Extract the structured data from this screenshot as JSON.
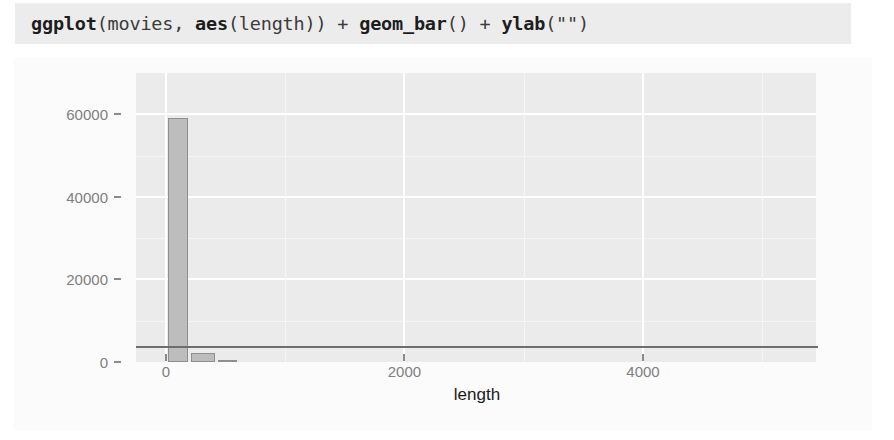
{
  "code": {
    "segments": [
      {
        "text": "ggplot",
        "bold": true
      },
      {
        "text": "(movies, ",
        "bold": false
      },
      {
        "text": "aes",
        "bold": true
      },
      {
        "text": "(length)) + ",
        "bold": false
      },
      {
        "text": "geom_bar",
        "bold": true
      },
      {
        "text": "() + ",
        "bold": false
      },
      {
        "text": "ylab",
        "bold": true
      },
      {
        "text": "(\"\")",
        "bold": false
      }
    ],
    "full_text": "ggplot(movies, aes(length)) + geom_bar() + ylab(\"\")",
    "background_color": "#ececec"
  },
  "chart_data": {
    "type": "bar",
    "title": "",
    "xlabel": "length",
    "ylabel": "",
    "xlim": [
      -250,
      5450
    ],
    "ylim": [
      0,
      70000
    ],
    "x_ticks": [
      0,
      2000,
      4000
    ],
    "x_tick_labels": [
      "0",
      "2000",
      "4000"
    ],
    "y_ticks": [
      0,
      20000,
      40000,
      60000
    ],
    "y_tick_labels": [
      "0",
      "20000",
      "40000",
      "60000"
    ],
    "x_minor_ticks": [
      1000,
      3000,
      5000
    ],
    "y_minor_ticks": [
      10000,
      30000,
      50000
    ],
    "grid": true,
    "legend": "none",
    "panel_background": "#ebebeb",
    "grid_color": "#ffffff",
    "bar_fill": "#bdbdbd",
    "bar_outline": "#8f8f8f",
    "categories": [
      100,
      310,
      520
    ],
    "values": [
      59000,
      2300,
      400
    ],
    "bars": [
      {
        "x": 100,
        "width": 170,
        "value": 59000
      },
      {
        "x": 310,
        "width": 200,
        "value": 2300
      },
      {
        "x": 520,
        "width": 160,
        "value": 400
      }
    ]
  },
  "figure": {
    "background_color": "#fbfbfb"
  }
}
